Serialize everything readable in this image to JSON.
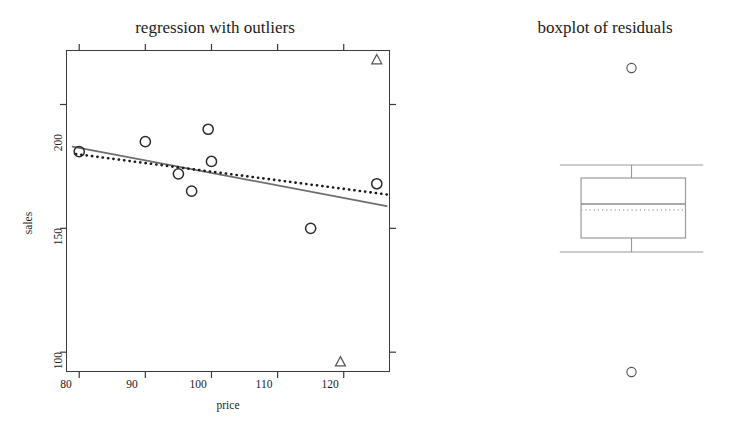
{
  "figure": {
    "background": "#ffffff",
    "width": 745,
    "height": 428
  },
  "panels": {
    "regression": {
      "title": "regression with outliers",
      "xlabel": "price",
      "ylabel": "sales"
    },
    "boxplot": {
      "title": "boxplot of residuals"
    }
  },
  "colors": {
    "frame": "#3a3a3a",
    "ols_line": "#6e6e6e",
    "robust_line": "#1a1a1a",
    "point_stroke": "#2b2b2b",
    "outlier_stroke": "#555555",
    "box_stroke": "#9a9a9a",
    "median_line": "#8c8c8c",
    "dotted_median": "#aaaaaa",
    "text": "#1c1c1c"
  },
  "chart_data": [
    {
      "type": "scatter",
      "id": "regression-with-outliers",
      "title": "regression with outliers",
      "xlabel": "price",
      "ylabel": "sales",
      "xlim": [
        78,
        127
      ],
      "ylim": [
        92,
        222
      ],
      "xticks": [
        80,
        90,
        100,
        110,
        120
      ],
      "yticks": [
        100,
        150,
        200
      ],
      "grid": false,
      "legend": null,
      "points": [
        {
          "x": 80.0,
          "y": 181.0,
          "marker": "circle"
        },
        {
          "x": 90.0,
          "y": 185.0,
          "marker": "circle"
        },
        {
          "x": 95.0,
          "y": 172.0,
          "marker": "circle"
        },
        {
          "x": 97.0,
          "y": 165.0,
          "marker": "circle"
        },
        {
          "x": 99.5,
          "y": 190.0,
          "marker": "circle"
        },
        {
          "x": 100.0,
          "y": 177.0,
          "marker": "circle"
        },
        {
          "x": 115.0,
          "y": 150.0,
          "marker": "circle"
        },
        {
          "x": 125.0,
          "y": 168.0,
          "marker": "circle"
        }
      ],
      "outliers": [
        {
          "x": 125.0,
          "y": 218.0,
          "marker": "triangle",
          "label": "high outlier"
        },
        {
          "x": 119.5,
          "y": 96.0,
          "marker": "triangle",
          "label": "low outlier"
        }
      ],
      "series": [
        {
          "name": "ols-fit",
          "type": "line",
          "style": "solid",
          "color": "#6e6e6e",
          "x": [
            79.0,
            126.5
          ],
          "y": [
            183.0,
            159.0
          ]
        },
        {
          "name": "robust-fit",
          "type": "line",
          "style": "dotted",
          "color": "#1a1a1a",
          "x": [
            79.5,
            127.0
          ],
          "y": [
            180.0,
            163.5
          ]
        }
      ]
    },
    {
      "type": "boxplot",
      "id": "boxplot-of-residuals",
      "title": "boxplot of residuals",
      "orientation": "horizontal",
      "grid": false,
      "boxes": [
        {
          "name": "residuals",
          "whisker_low": 0.095,
          "q1": 0.215,
          "median": 0.5,
          "q3": 0.805,
          "whisker_high": 0.905,
          "outliers": [
            0.5,
            0.5
          ],
          "outlier_positions": [
            {
              "axis": 0.5,
              "value": 0.97,
              "marker": "circle"
            },
            {
              "axis": 0.5,
              "value": 0.03,
              "marker": "circle"
            }
          ]
        }
      ]
    }
  ]
}
